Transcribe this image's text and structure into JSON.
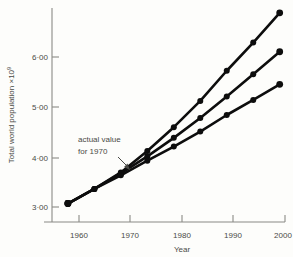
{
  "chart_data": {
    "type": "line",
    "title": "",
    "xlabel": "Year",
    "ylabel": "Total world population ×10",
    "ylabel_exponent": "9",
    "xlim": [
      1957,
      2001
    ],
    "ylim": [
      2.62,
      7.02
    ],
    "grid": false,
    "legend": "none",
    "x": [
      1960,
      1965,
      1970,
      1975,
      1980,
      1985,
      1990,
      1995,
      2000
    ],
    "xticks": [
      1960,
      1970,
      1980,
      1990,
      2000
    ],
    "xtick_labels": [
      "1960",
      "1970",
      "1980",
      "1990",
      "2000"
    ],
    "yticks": [
      3.0,
      4.0,
      5.0,
      6.0
    ],
    "ytick_labels": [
      "3·00",
      "4·00",
      "5·00",
      "6·00"
    ],
    "series": [
      {
        "name": "high projection",
        "values": [
          3.0,
          3.3,
          3.64,
          4.08,
          4.57,
          5.11,
          5.73,
          6.31,
          6.92
        ]
      },
      {
        "name": "medium projection",
        "values": [
          3.0,
          3.3,
          3.62,
          3.97,
          4.35,
          4.76,
          5.2,
          5.66,
          6.12
        ]
      },
      {
        "name": "low projection",
        "values": [
          3.0,
          3.3,
          3.58,
          3.88,
          4.17,
          4.48,
          4.82,
          5.13,
          5.45
        ]
      }
    ],
    "annotations": [
      {
        "text_line1": "actual value",
        "text_line2": "for 1970",
        "points_to_x": 1970,
        "points_to_y": 3.62
      }
    ]
  },
  "colors": {
    "background": "#fdfdfb",
    "line": "#0d0d0d",
    "marker": "#0d0d0d",
    "axis": "#8a8a86",
    "text": "#4a4a46"
  }
}
